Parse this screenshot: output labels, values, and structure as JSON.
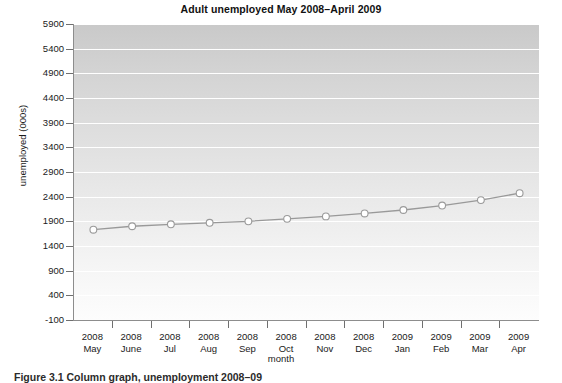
{
  "chart_data": {
    "type": "line",
    "title": "Adult unemployed May 2008–April 2009",
    "xlabel": "month",
    "ylabel": "unemployed (000s)",
    "categories": [
      "2008 May",
      "2008 June",
      "2008 Jul",
      "2008 Aug",
      "2008 Sep",
      "2008 Oct",
      "2008 Nov",
      "2008 Dec",
      "2009 Jan",
      "2009 Feb",
      "2009 Mar",
      "2009 Apr"
    ],
    "category_lines": [
      [
        "2008",
        "May"
      ],
      [
        "2008",
        "June"
      ],
      [
        "2008",
        "Jul"
      ],
      [
        "2008",
        "Aug"
      ],
      [
        "2008",
        "Sep"
      ],
      [
        "2008",
        "Oct"
      ],
      [
        "2008",
        "Nov"
      ],
      [
        "2008",
        "Dec"
      ],
      [
        "2009",
        "Jan"
      ],
      [
        "2009",
        "Feb"
      ],
      [
        "2009",
        "Mar"
      ],
      [
        "2009",
        "Apr"
      ]
    ],
    "values": [
      1730,
      1800,
      1840,
      1870,
      1900,
      1950,
      2000,
      2060,
      2130,
      2220,
      2330,
      2470
    ],
    "ylim": [
      -100,
      5900
    ],
    "yticks": [
      5900,
      5400,
      4900,
      4400,
      3900,
      3400,
      2900,
      2400,
      1900,
      1400,
      900,
      400,
      -100
    ],
    "ytick_labels": [
      "5900",
      "5400",
      "4900",
      "4400",
      "3900",
      "3400",
      "2900",
      "2400",
      "1900",
      "1400",
      "900",
      "400",
      "-100"
    ],
    "grid": true,
    "legend": false,
    "series_name": "unemployed",
    "marker": "circle-open",
    "colors": {
      "line": "#999999",
      "marker_fill": "#ffffff",
      "marker_edge": "#9a9a9a",
      "grid": "#ffffff",
      "axis": "#8d8d8d",
      "plot_top": "#c9c9c9",
      "plot_bottom": "#fdfdfd",
      "text": "#1a1a1a"
    }
  },
  "caption": {
    "text": "Figure 3.1   Column graph, unemployment 2008–09"
  }
}
